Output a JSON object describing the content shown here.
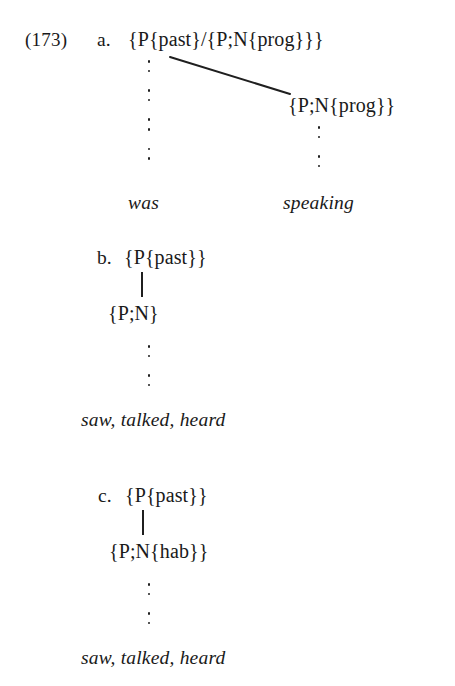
{
  "figure": {
    "example_number": "(173)",
    "background_color": "#ffffff",
    "ink_color": "#1a1a1a"
  },
  "items": [
    {
      "letter": "a.",
      "root": "{P{past}/{P;N{prog}}}",
      "branch_node": "{P;N{prog}}",
      "left_terminal": "was",
      "right_terminal": "speaking",
      "left_ellipsis_groups": 4,
      "right_ellipsis_groups": 2,
      "connector": "diagonal"
    },
    {
      "letter": "b.",
      "root": "{P{past}}",
      "daughter": "{P;N}",
      "terminal": "saw, talked, heard",
      "ellipsis_groups": 2,
      "connector": "vertical-stem"
    },
    {
      "letter": "c.",
      "root": "{P{past}}",
      "daughter": "{P;N{hab}}",
      "terminal": "saw, talked, heard",
      "ellipsis_groups": 2,
      "connector": "vertical-stem"
    }
  ]
}
